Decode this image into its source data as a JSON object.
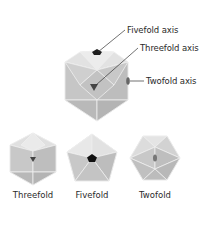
{
  "labels": {
    "fivefold_axis": "Fivefold axis",
    "threefold_axis": "Threefold axis",
    "twofold_axis": "Twofold axis"
  },
  "captions": {
    "threefold": "Threefold",
    "fivefold": "Fivefold",
    "twofold": "Twofold"
  },
  "colors": {
    "face_dark": "#b8b8b8",
    "face_mid": "#c9c9c9",
    "face_light": "#e4e4e4",
    "edge": "#f2f2f2",
    "marker": "#222222",
    "leader": "#333333"
  }
}
